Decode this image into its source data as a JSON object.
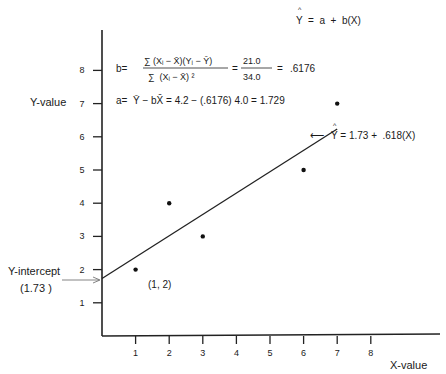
{
  "chart_data": {
    "type": "scatter",
    "title": "",
    "xlabel": "X-value",
    "ylabel": "Y-value",
    "xlim": [
      0,
      10
    ],
    "ylim": [
      0,
      9
    ],
    "x_ticks": [
      1,
      2,
      3,
      4,
      5,
      6,
      7,
      8
    ],
    "y_ticks": [
      1,
      2,
      3,
      4,
      5,
      6,
      7,
      8
    ],
    "grid": false,
    "points": [
      {
        "x": 1,
        "y": 2
      },
      {
        "x": 2,
        "y": 4
      },
      {
        "x": 3,
        "y": 3
      },
      {
        "x": 6,
        "y": 5
      },
      {
        "x": 7,
        "y": 7
      }
    ],
    "regression_line": {
      "intercept": 1.73,
      "slope": 0.618,
      "x_start": 0,
      "x_end": 7
    },
    "annotations": {
      "model": {
        "hat": "^",
        "text": "Y  =  a  +  b(X)"
      },
      "b_label": "b=",
      "b_numerator": "∑ (Xᵢ − X̄)(Yᵢ − Ȳ)",
      "b_denominator": "∑  (Xᵢ − X̄) ²",
      "b_eq1": "=",
      "b_frac_num": "21.0",
      "b_frac_den": "34.0",
      "b_eq2": "=",
      "b_value": ".6176",
      "a_line": "a=  Ȳ − bX̄ = 4.2 − (.6176) 4.0 = 1.729",
      "fitted": {
        "arrow": "⟵",
        "hat": "^",
        "text": "Y = 1.73 +  .618(X)"
      },
      "point_label": "(1, 2)",
      "intercept_label_1": "Y-intercept",
      "intercept_label_2": "(1.73 )"
    }
  }
}
